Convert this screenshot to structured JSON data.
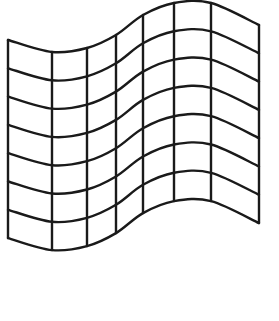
{
  "figure": {
    "title": "",
    "stroke_color": "#1a1a1a",
    "background_color": "#ffffff",
    "stroke_width": 2.4,
    "columns": 7,
    "rows": 7,
    "vertical_lines_x": [
      8,
      52,
      87,
      116,
      143,
      174,
      211,
      259
    ],
    "top_curve_y": [
      40,
      52,
      48,
      35,
      15,
      3,
      3,
      25
    ],
    "row_spacing": 28.3
  }
}
